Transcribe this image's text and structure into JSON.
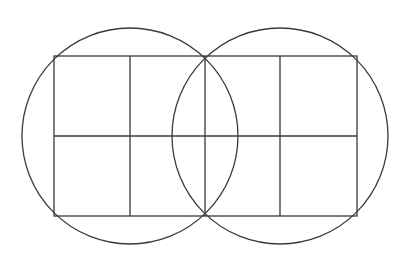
{
  "canvas": {
    "width": 410,
    "height": 265,
    "background": "#ffffff"
  },
  "style": {
    "stroke": "#3a3a3a",
    "stroke_width": 1.3
  },
  "circles": [
    {
      "name": "left-circle",
      "cx": 130,
      "cy": 136,
      "r": 108
    },
    {
      "name": "right-circle",
      "cx": 280,
      "cy": 136,
      "r": 108
    }
  ],
  "rectangle": {
    "x1": 54,
    "y1": 56,
    "x2": 357,
    "y2": 216
  },
  "grid": {
    "vertical_lines_x": [
      130,
      205,
      280
    ],
    "horizontal_lines_y": [
      136
    ]
  }
}
